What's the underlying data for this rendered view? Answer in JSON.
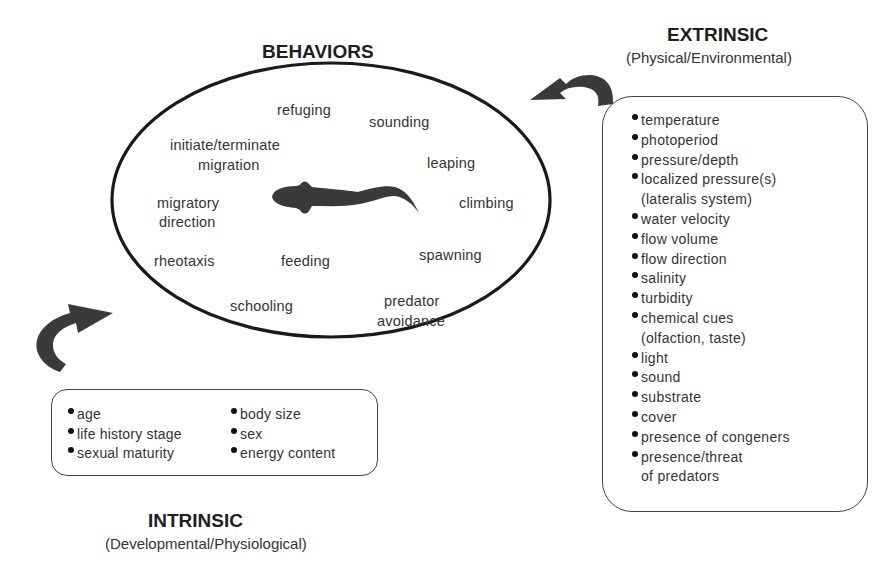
{
  "behaviors": {
    "title": "BEHAVIORS",
    "items": {
      "refuging": "refuging",
      "sounding": "sounding",
      "initiate_terminate": "initiate/terminate",
      "migration": "migration",
      "leaping": "leaping",
      "migratory": "migratory",
      "direction": "direction",
      "climbing": "climbing",
      "rheotaxis": "rheotaxis",
      "feeding": "feeding",
      "spawning": "spawning",
      "schooling": "schooling",
      "predator": "predator",
      "avoidance": "avoidance"
    },
    "center_icon": "fish-silhouette-icon"
  },
  "extrinsic": {
    "title": "EXTRINSIC",
    "subtitle": "(Physical/Environmental)",
    "items": [
      {
        "label": "temperature"
      },
      {
        "label": "photoperiod"
      },
      {
        "label": "pressure/depth"
      },
      {
        "label": "localized pressure(s)",
        "cont": "(lateralis system)"
      },
      {
        "label": "water velocity"
      },
      {
        "label": "flow volume"
      },
      {
        "label": "flow direction"
      },
      {
        "label": "salinity"
      },
      {
        "label": "turbidity"
      },
      {
        "label": "chemical cues",
        "cont": "(olfaction, taste)"
      },
      {
        "label": "light"
      },
      {
        "label": "sound"
      },
      {
        "label": "substrate"
      },
      {
        "label": "cover"
      },
      {
        "label": "presence of congeners"
      },
      {
        "label": "presence/threat",
        "cont": "of predators"
      }
    ],
    "arrow_icon": "curved-arrow-left-icon"
  },
  "intrinsic": {
    "title": "INTRINSIC",
    "subtitle": "(Developmental/Physiological)",
    "col1": [
      {
        "label": "age"
      },
      {
        "label": "life history stage"
      },
      {
        "label": "sexual maturity"
      }
    ],
    "col2": [
      {
        "label": "body size"
      },
      {
        "label": "sex"
      },
      {
        "label": "energy content"
      }
    ],
    "arrow_icon": "curved-arrow-right-icon"
  },
  "colors": {
    "ink": "#2a2a2a",
    "arrow": "#3a3a3a",
    "background": "#ffffff"
  }
}
